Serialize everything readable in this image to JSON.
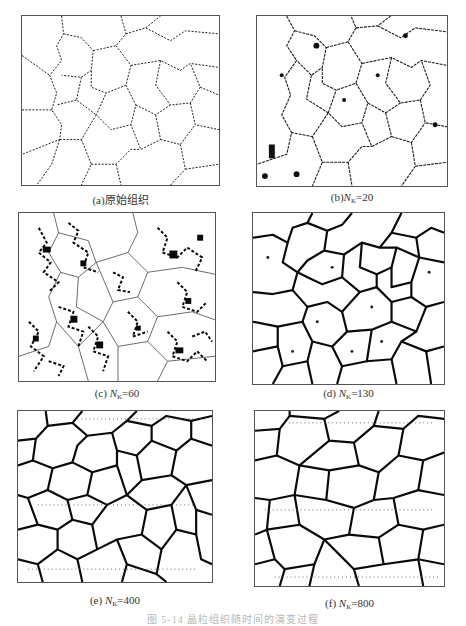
{
  "figure": {
    "caption": "图 5-14  晶粒组织随时间的演变过程",
    "caption_visibility": "faint, partially cut off at bottom edge",
    "panels": [
      {
        "id": "a",
        "label_prefix": "(a)",
        "label_text": "原始组织",
        "symbol": "",
        "value": "",
        "density": "sparse"
      },
      {
        "id": "b",
        "label_prefix": "(b)",
        "label_text": "",
        "symbol": "N",
        "subscript": "K",
        "value": "=20",
        "density": "sparse"
      },
      {
        "id": "c",
        "label_prefix": "(c) ",
        "label_text": "",
        "symbol": "N",
        "subscript": "K",
        "value": "=60",
        "density": "dense"
      },
      {
        "id": "d",
        "label_prefix": "(d) ",
        "label_text": "",
        "symbol": "N",
        "subscript": "K",
        "value": "=130",
        "density": "thick"
      },
      {
        "id": "e",
        "label_prefix": "(e) ",
        "label_text": "",
        "symbol": "N",
        "subscript": "K",
        "value": "=400",
        "density": "thick"
      },
      {
        "id": "f",
        "label_prefix": "(f) ",
        "label_text": "",
        "symbol": "N",
        "subscript": "K",
        "value": "=800",
        "density": "thick"
      }
    ]
  },
  "colors": {
    "background": "#ffffff",
    "grain_boundary": "#111111",
    "frame": "#555555",
    "caption_text": "#333333"
  }
}
